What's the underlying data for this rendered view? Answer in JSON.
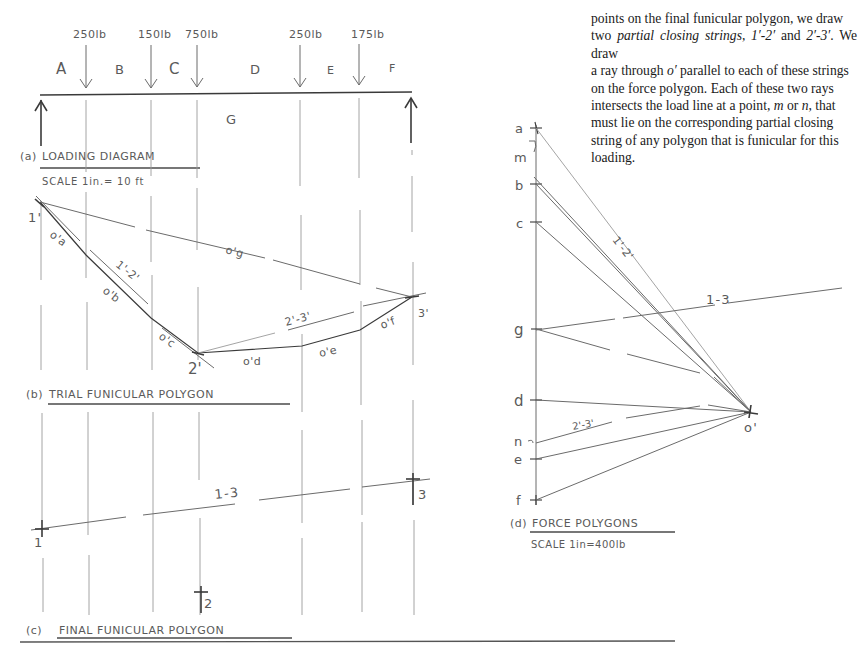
{
  "paragraph": {
    "lines": [
      "points on the final funicular polygon, we draw",
      "two ",
      "partial closing strings",
      ", ",
      "1′-2′",
      " and ",
      "2′-3′",
      ". We draw",
      "a ray through ",
      "o′",
      " parallel to each of these strings",
      "on the force polygon. Each of these two rays",
      "intersects the load line at a point, ",
      "m",
      " or ",
      "n",
      ", that",
      "must lie on the corresponding partial closing",
      "string of any polygon that is funicular for this",
      "loading."
    ]
  },
  "loading_diagram": {
    "loads": [
      "250lb",
      "150lb",
      "750lb",
      "250lb",
      "175lb"
    ],
    "spaces": [
      "A",
      "B",
      "C",
      "D",
      "E",
      "F"
    ],
    "below_label": "G",
    "caption_prefix": "(a)",
    "caption": "LOADING DIAGRAM",
    "scale": "SCALE  1in.= 10 ft"
  },
  "trial_polygon": {
    "caption_prefix": "(b)",
    "caption": "TRIAL FUNICULAR POLYGON",
    "point_labels": [
      "1'",
      "2'",
      "3'"
    ],
    "segment_labels": [
      "o'a",
      "o'b",
      "o'c",
      "o'd",
      "o'e",
      "o'f",
      "o'g"
    ],
    "closing_labels": [
      "1'-2'",
      "2'-3'"
    ]
  },
  "final_polygon": {
    "caption_prefix": "(c)",
    "caption": "FINAL FUNICULAR POLYGON",
    "point_labels": [
      "1",
      "2",
      "3"
    ],
    "closing_label": "1-3"
  },
  "force_polygon": {
    "caption_prefix": "(d)",
    "caption": "FORCE POLYGONS",
    "scale": "SCALE  1in=400lb",
    "load_line_points": [
      "a",
      "m",
      "b",
      "c",
      "g",
      "d",
      "n",
      "e",
      "f"
    ],
    "pole_label": "o'",
    "ray_labels": [
      "1'-2'",
      "1-3",
      "2'-3'"
    ]
  }
}
